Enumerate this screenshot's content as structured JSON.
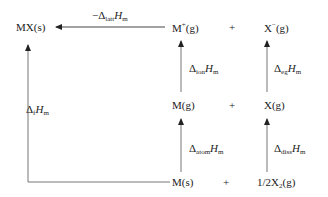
{
  "diagram": {
    "type": "Born-Haber cycle",
    "species": {
      "mx_s": "MX(s)",
      "m_plus_g": {
        "base": "M",
        "sup": "+",
        "state": "(g)"
      },
      "x_minus_g": {
        "base": "X",
        "sup": "−",
        "state": "(g)"
      },
      "m_g": "M(g)",
      "x_g": "X(g)",
      "m_s": "M(s)",
      "half_x2_g": {
        "prefix": "1/2X",
        "sub": "2",
        "state": "(g)"
      },
      "plus": "+"
    },
    "enthalpies": {
      "lattice": {
        "prefix": "−Δ",
        "sub": "latt",
        "H": "H",
        "m": "m"
      },
      "ionisation": {
        "prefix": "Δ",
        "sub": "ion",
        "H": "H",
        "m": "m"
      },
      "electron_gain": {
        "prefix": "Δ",
        "sub": "eg",
        "H": "H",
        "m": "m"
      },
      "atomisation": {
        "prefix": "Δ",
        "sub": "atom",
        "H": "H",
        "m": "m"
      },
      "dissociation": {
        "prefix": "Δ",
        "sub": "diss",
        "H": "H",
        "m": "m"
      },
      "formation": {
        "prefix": "Δ",
        "sub": "f",
        "H": "H",
        "m": "m"
      }
    },
    "colors": {
      "line": "#444444",
      "text": "#222222"
    }
  }
}
